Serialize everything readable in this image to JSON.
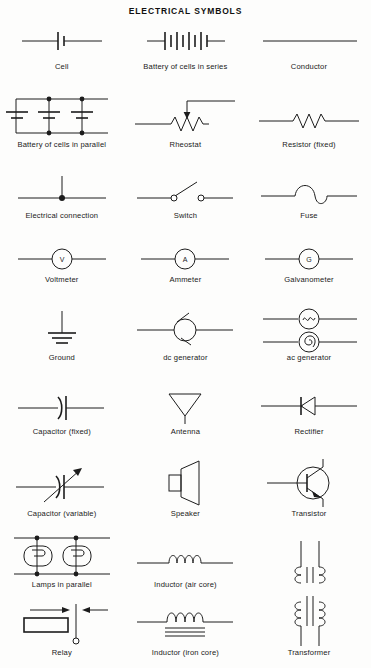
{
  "title": "ELECTRICAL SYMBOLS",
  "theme": {
    "background": "#fdfdfc",
    "ink": "#1c1c1c",
    "label_color": "#1a1a1a"
  },
  "rows": [
    {
      "cells": [
        {
          "label": "Cell",
          "icon": "cell-symbol"
        },
        {
          "label": "Battery of cells in series",
          "icon": "battery-series-symbol"
        },
        {
          "label": "Conductor",
          "icon": "conductor-symbol"
        }
      ]
    },
    {
      "cells": [
        {
          "label": "Battery of cells in parallel",
          "icon": "battery-parallel-symbol"
        },
        {
          "label": "Rheostat",
          "icon": "rheostat-symbol"
        },
        {
          "label": "Resistor (fixed)",
          "icon": "resistor-fixed-symbol"
        }
      ]
    },
    {
      "cells": [
        {
          "label": "Electrical connection",
          "icon": "electrical-connection-symbol"
        },
        {
          "label": "Switch",
          "icon": "switch-symbol"
        },
        {
          "label": "Fuse",
          "icon": "fuse-symbol"
        }
      ]
    },
    {
      "cells": [
        {
          "label": "Voltmeter",
          "icon": "voltmeter-symbol",
          "glyph": "V"
        },
        {
          "label": "Ammeter",
          "icon": "ammeter-symbol",
          "glyph": "A"
        },
        {
          "label": "Galvanometer",
          "icon": "galvanometer-symbol",
          "glyph": "G"
        }
      ]
    },
    {
      "cells": [
        {
          "label": "Ground",
          "icon": "ground-symbol"
        },
        {
          "label": "dc generator",
          "icon": "dc-generator-symbol"
        },
        {
          "label": "ac generator",
          "icon": "ac-generator-symbol"
        }
      ]
    },
    {
      "cells": [
        {
          "label": "Capacitor (fixed)",
          "icon": "capacitor-fixed-symbol"
        },
        {
          "label": "Antenna",
          "icon": "antenna-symbol"
        },
        {
          "label": "Rectifier",
          "icon": "rectifier-symbol"
        }
      ]
    },
    {
      "cells": [
        {
          "label": "Capacitor (variable)",
          "icon": "capacitor-variable-symbol"
        },
        {
          "label": "Speaker",
          "icon": "speaker-symbol"
        },
        {
          "label": "Transistor",
          "icon": "transistor-symbol"
        }
      ]
    },
    {
      "cells": [
        {
          "label": "Lamps in parallel",
          "icon": "lamps-parallel-symbol"
        },
        {
          "label": "Inductor (air core)",
          "icon": "inductor-air-core-symbol"
        },
        {
          "label": "",
          "icon": "transformer-upper-symbol"
        }
      ]
    },
    {
      "cells": [
        {
          "label": "Relay",
          "icon": "relay-symbol"
        },
        {
          "label": "Inductor (iron core)",
          "icon": "inductor-iron-core-symbol"
        },
        {
          "label": "Transformer",
          "icon": "transformer-symbol"
        }
      ]
    }
  ]
}
